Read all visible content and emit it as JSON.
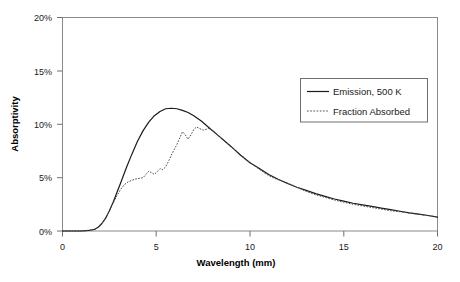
{
  "chart_data": {
    "type": "line",
    "title": "",
    "xlabel": "Wavelength (mm)",
    "ylabel": "Absorptivity",
    "xlim": [
      0,
      20
    ],
    "ylim": [
      0,
      20
    ],
    "xticks": [
      0,
      5,
      10,
      15,
      20
    ],
    "xtick_labels": [
      "0",
      "5",
      "10",
      "15",
      "20"
    ],
    "yticks": [
      0,
      5,
      10,
      15,
      20
    ],
    "ytick_labels": [
      "0%",
      "5%",
      "10%",
      "15%",
      "20%"
    ],
    "grid": false,
    "legend_position": "upper right",
    "series": [
      {
        "name": "Emission, 500 K",
        "style": "solid",
        "color": "#1a1a1a",
        "x": [
          0.0,
          0.5,
          1.0,
          1.4,
          1.7,
          1.9,
          2.1,
          2.3,
          2.5,
          2.7,
          2.9,
          3.1,
          3.4,
          3.7,
          4.0,
          4.3,
          4.6,
          4.9,
          5.2,
          5.5,
          5.8,
          6.1,
          6.4,
          6.7,
          7.0,
          7.4,
          7.8,
          8.2,
          8.6,
          9.0,
          9.5,
          10.0,
          10.5,
          11.0,
          11.5,
          12.0,
          12.5,
          13.0,
          13.5,
          14.0,
          14.5,
          15.0,
          15.5,
          16.0,
          16.5,
          17.0,
          17.5,
          18.0,
          18.5,
          19.0,
          19.5,
          20.0
        ],
        "y": [
          0.0,
          0.0,
          0.0,
          0.05,
          0.15,
          0.35,
          0.7,
          1.2,
          1.9,
          2.7,
          3.6,
          4.5,
          5.9,
          7.2,
          8.4,
          9.4,
          10.2,
          10.8,
          11.2,
          11.45,
          11.5,
          11.45,
          11.3,
          11.1,
          10.8,
          10.3,
          9.7,
          9.1,
          8.5,
          7.9,
          7.1,
          6.4,
          5.85,
          5.3,
          4.85,
          4.45,
          4.1,
          3.8,
          3.5,
          3.25,
          3.0,
          2.8,
          2.6,
          2.45,
          2.3,
          2.15,
          2.0,
          1.85,
          1.7,
          1.58,
          1.45,
          1.3
        ]
      },
      {
        "name": "Fraction Absorbed",
        "style": "dotted",
        "color": "#4a4a4a",
        "x": [
          0.0,
          0.5,
          1.0,
          1.4,
          1.7,
          1.9,
          2.1,
          2.3,
          2.5,
          2.7,
          2.9,
          3.1,
          3.3,
          3.5,
          3.7,
          3.85,
          4.0,
          4.15,
          4.3,
          4.45,
          4.6,
          4.75,
          4.9,
          5.05,
          5.2,
          5.35,
          5.5,
          5.65,
          5.8,
          5.95,
          6.1,
          6.25,
          6.4,
          6.55,
          6.7,
          6.85,
          7.0,
          7.15,
          7.3,
          7.5,
          7.8,
          8.1,
          8.4,
          8.8,
          9.2,
          9.6,
          10.0,
          10.4,
          10.8,
          11.2,
          11.6,
          12.0,
          12.5,
          13.0,
          13.5,
          14.0,
          14.5,
          15.0,
          15.5,
          16.0,
          16.5,
          17.0,
          17.5,
          18.0,
          18.5,
          19.0,
          19.5,
          20.0
        ],
        "y": [
          0.0,
          0.0,
          0.0,
          0.05,
          0.15,
          0.35,
          0.7,
          1.2,
          1.9,
          2.6,
          3.3,
          3.9,
          4.35,
          4.6,
          4.75,
          4.85,
          4.9,
          4.95,
          5.0,
          5.3,
          5.6,
          5.45,
          5.3,
          5.55,
          5.85,
          5.75,
          6.0,
          6.5,
          7.1,
          7.6,
          8.1,
          8.7,
          9.3,
          9.0,
          8.6,
          9.0,
          9.5,
          9.75,
          9.6,
          9.45,
          9.6,
          9.3,
          8.8,
          8.2,
          7.6,
          7.0,
          6.4,
          5.9,
          5.4,
          5.0,
          4.75,
          4.5,
          4.1,
          3.7,
          3.4,
          3.15,
          2.9,
          2.7,
          2.5,
          2.35,
          2.2,
          2.05,
          1.9,
          1.8,
          1.68,
          1.56,
          1.44,
          1.32
        ]
      }
    ],
    "legend_entries": [
      {
        "label": "Emission, 500 K",
        "style": "solid"
      },
      {
        "label": "Fraction Absorbed",
        "style": "dotted"
      }
    ]
  },
  "axes": {
    "x_title": "Wavelength (mm)",
    "y_title": "Absorptivity",
    "x_tick_labels": [
      "0",
      "5",
      "10",
      "15",
      "20"
    ],
    "y_tick_labels": [
      "0%",
      "5%",
      "10%",
      "15%",
      "20%"
    ]
  },
  "legend": {
    "entry_1_label": "Emission, 500 K",
    "entry_2_label": "Fraction Absorbed"
  },
  "colors": {
    "series_solid": "#1a1a1a",
    "series_dotted": "#4a4a4a",
    "frame": "#8a8a8a",
    "background": "#ffffff"
  }
}
